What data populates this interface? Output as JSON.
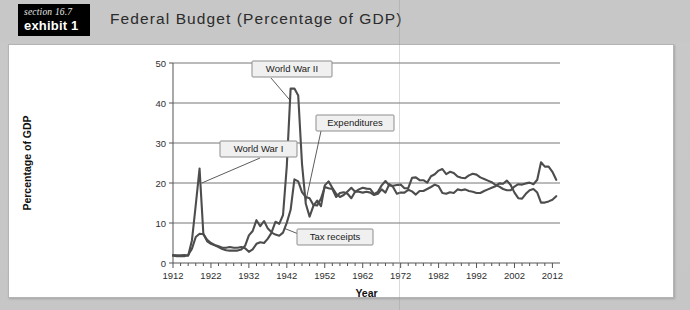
{
  "header": {
    "section_label": "section 16.7",
    "exhibit_label": "exhibit 1",
    "title": "Federal Budget (Percentage of GDP)",
    "badge_bg": "#000000",
    "band_bg": "#c7c7c7"
  },
  "chart_data": {
    "type": "line",
    "title": "Federal Budget (Percentage of GDP)",
    "xlabel": "Year",
    "ylabel": "Percentage of GDP",
    "xlim": [
      1912,
      2014
    ],
    "ylim": [
      0,
      50
    ],
    "ytick_labels": [
      "0",
      "10",
      "20",
      "30",
      "40",
      "50"
    ],
    "yticks": [
      0,
      10,
      20,
      30,
      40,
      50
    ],
    "xtick_labels": [
      "1912",
      "1922",
      "1932",
      "1942",
      "1952",
      "1962",
      "1972",
      "1982",
      "1992",
      "2002",
      "2012"
    ],
    "xticks": [
      1912,
      1922,
      1932,
      1942,
      1952,
      1962,
      1972,
      1982,
      1992,
      2002,
      2012
    ],
    "grid": "horizontal",
    "legend_position": "inline-annotations",
    "line_color": "#4d4d4d",
    "annotations": [
      {
        "id": "ww2",
        "label": "World War II",
        "points_to_year": 1944,
        "points_to_value": 43
      },
      {
        "id": "expenditures",
        "label": "Expenditures",
        "points_to_year": 1947,
        "points_to_value": 15
      },
      {
        "id": "ww1",
        "label": "World War I",
        "points_to_year": 1919,
        "points_to_value": 22
      },
      {
        "id": "tax-receipts",
        "label": "Tax receipts",
        "points_to_year": 1941,
        "points_to_value": 7
      }
    ],
    "x": [
      1912,
      1913,
      1914,
      1915,
      1916,
      1917,
      1918,
      1919,
      1920,
      1921,
      1922,
      1923,
      1924,
      1925,
      1926,
      1927,
      1928,
      1929,
      1930,
      1931,
      1932,
      1933,
      1934,
      1935,
      1936,
      1937,
      1938,
      1939,
      1940,
      1941,
      1942,
      1943,
      1944,
      1945,
      1946,
      1947,
      1948,
      1949,
      1950,
      1951,
      1952,
      1953,
      1954,
      1955,
      1956,
      1957,
      1958,
      1959,
      1960,
      1961,
      1962,
      1963,
      1964,
      1965,
      1966,
      1967,
      1968,
      1969,
      1970,
      1971,
      1972,
      1973,
      1974,
      1975,
      1976,
      1977,
      1978,
      1979,
      1980,
      1981,
      1982,
      1983,
      1984,
      1985,
      1986,
      1987,
      1988,
      1989,
      1990,
      1991,
      1992,
      1993,
      1994,
      1995,
      1996,
      1997,
      1998,
      1999,
      2000,
      2001,
      2002,
      2003,
      2004,
      2005,
      2006,
      2007,
      2008,
      2009,
      2010,
      2011,
      2012,
      2013
    ],
    "series": [
      {
        "name": "Expenditures",
        "values": [
          2.0,
          1.9,
          1.9,
          2.0,
          1.8,
          5.7,
          14.5,
          23.6,
          7.3,
          5.4,
          4.8,
          4.4,
          4.0,
          3.5,
          3.2,
          3.1,
          3.1,
          3.1,
          3.4,
          4.3,
          6.9,
          8.0,
          10.7,
          9.2,
          10.5,
          8.6,
          7.7,
          10.3,
          9.8,
          12.0,
          24.3,
          43.6,
          43.6,
          41.9,
          24.8,
          14.8,
          11.6,
          14.3,
          15.6,
          14.2,
          19.4,
          20.4,
          18.8,
          17.3,
          16.5,
          17.0,
          17.9,
          18.8,
          17.8,
          18.4,
          18.8,
          18.6,
          18.5,
          17.2,
          17.8,
          19.4,
          20.5,
          19.4,
          19.3,
          19.5,
          19.6,
          18.7,
          18.7,
          21.3,
          21.4,
          20.7,
          20.7,
          20.1,
          21.7,
          22.2,
          23.1,
          23.5,
          22.2,
          22.8,
          22.5,
          21.6,
          21.3,
          21.2,
          21.9,
          22.3,
          22.1,
          21.4,
          21.0,
          20.6,
          20.2,
          19.5,
          19.1,
          18.5,
          18.2,
          18.2,
          19.1,
          19.7,
          19.6,
          19.9,
          20.1,
          19.7,
          20.8,
          25.2,
          24.1,
          24.1,
          22.8,
          20.8
        ]
      },
      {
        "name": "Tax receipts",
        "values": [
          1.8,
          1.7,
          1.7,
          1.7,
          2.0,
          3.6,
          6.5,
          7.3,
          7.2,
          5.8,
          5.0,
          4.5,
          4.2,
          3.8,
          3.8,
          4.0,
          3.8,
          3.8,
          4.0,
          3.7,
          2.8,
          3.4,
          4.8,
          5.2,
          5.0,
          6.1,
          7.6,
          7.1,
          6.8,
          7.6,
          10.1,
          13.3,
          20.9,
          20.4,
          17.7,
          16.5,
          16.2,
          14.5,
          14.4,
          16.1,
          19.0,
          18.7,
          18.5,
          16.5,
          17.5,
          17.7,
          17.3,
          16.2,
          17.8,
          17.8,
          17.6,
          17.8,
          17.6,
          17.0,
          17.3,
          18.4,
          17.6,
          19.7,
          19.0,
          17.3,
          17.6,
          17.6,
          18.3,
          17.9,
          17.1,
          18.0,
          18.0,
          18.5,
          19.0,
          19.6,
          19.2,
          17.5,
          17.3,
          17.7,
          17.5,
          18.4,
          18.2,
          18.4,
          18.0,
          17.8,
          17.5,
          17.5,
          18.0,
          18.4,
          18.8,
          19.2,
          19.9,
          19.8,
          20.6,
          19.5,
          17.6,
          16.2,
          16.1,
          17.3,
          18.2,
          18.5,
          17.6,
          15.1,
          15.1,
          15.4,
          15.8,
          16.7
        ]
      }
    ]
  }
}
